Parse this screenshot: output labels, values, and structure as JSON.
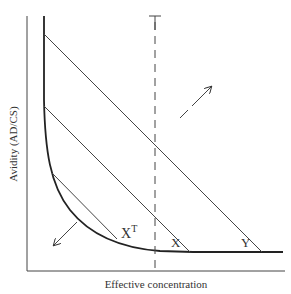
{
  "diagram": {
    "type": "line-diagram",
    "x_axis_label": "Effective concentration",
    "y_axis_label": "Avidity (AD/CS)",
    "threshold_label": "T",
    "lines": [
      {
        "label": "Y",
        "sub": ""
      },
      {
        "label": "X",
        "sub": ""
      },
      {
        "label": "X",
        "sup": "T"
      }
    ],
    "arrows": [
      {
        "direction": "up-right",
        "style": "dashed-tail"
      },
      {
        "direction": "down-left",
        "style": "solid"
      }
    ],
    "colors": {
      "ink": "#333333",
      "background": "#ffffff"
    }
  }
}
